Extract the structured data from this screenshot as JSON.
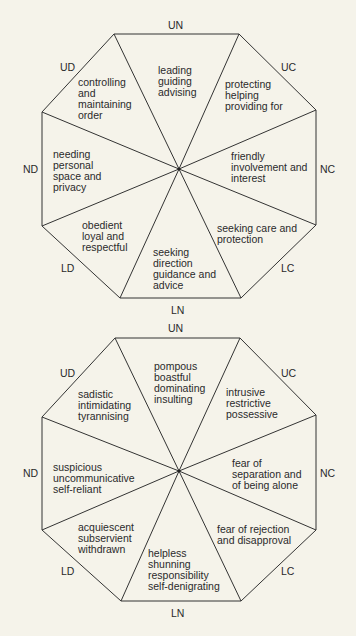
{
  "top_diagram": {
    "axes": {
      "UN": "UN",
      "UC": "UC",
      "NC": "NC",
      "LC": "LC",
      "LN": "LN",
      "LD": "LD",
      "ND": "ND",
      "UD": "UD"
    },
    "segments": {
      "UN": "leading\nguiding\nadvising",
      "UC": "protecting\nhelping\nproviding for",
      "NC": "friendly\ninvolvement and\ninterest",
      "LC": "seeking care and\nprotection",
      "LN": "seeking\ndirection\nguidance and\nadvice",
      "LD": "obedient\nloyal and\nrespectful",
      "ND": "needing\npersonal\nspace and\nprivacy",
      "UD": "controlling\nand\nmaintaining\norder"
    }
  },
  "bottom_diagram": {
    "axes": {
      "UN": "UN",
      "UC": "UC",
      "NC": "NC",
      "LC": "LC",
      "LN": "LN",
      "LD": "LD",
      "ND": "ND",
      "UD": "UD"
    },
    "segments": {
      "UN": "pompous\nboastful\ndominating\ninsulting",
      "UC": "intrusive\nrestrictive\npossessive",
      "NC": "fear of\nseparation and\nof being alone",
      "LC": "fear of rejection\nand disapproval",
      "LN": "helpless\nshunning\nresponsibility\nself-denigrating",
      "LD": "acquiescent\nsubservient\nwithdrawn",
      "ND": "suspicious\nuncommunicative\nself-reliant",
      "UD": "sadistic\nintimidating\ntyrannising"
    }
  },
  "colors": {
    "background": "#f5f3ea",
    "line": "#333333",
    "text": "#2a2a2a"
  }
}
